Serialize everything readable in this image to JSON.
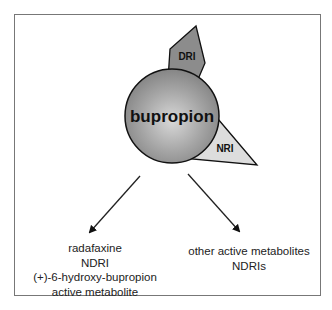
{
  "diagram": {
    "center": {
      "label": "bupropion",
      "color": "#9a9a9a"
    },
    "lobes": [
      {
        "label": "DRI",
        "color": "#8a8a8a"
      },
      {
        "label": "NRI",
        "color": "#dcdcdc"
      }
    ],
    "outputs": [
      {
        "lines": [
          "radafaxine",
          "NDRI",
          "(+)-6-hydroxy-bupropion",
          "active metabolite"
        ]
      },
      {
        "lines": [
          "other active metabolites",
          "NDRIs"
        ]
      }
    ]
  }
}
